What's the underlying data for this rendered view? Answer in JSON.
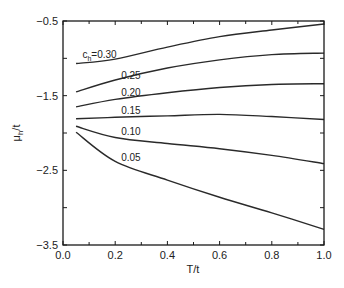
{
  "chart_data": {
    "type": "line",
    "title": "",
    "xlabel": "T/t",
    "ylabel": "μh/t",
    "xlim": [
      0.0,
      1.0
    ],
    "ylim": [
      -3.5,
      -0.5
    ],
    "xticks": [
      "0.0",
      "0.2",
      "0.4",
      "0.6",
      "0.8",
      "1.0"
    ],
    "yticks": [
      "-3.5",
      "-2.5",
      "-1.5",
      "-0.5"
    ],
    "grid": false,
    "legend": "inline labels",
    "x": [
      0.05,
      0.2,
      0.4,
      0.6,
      0.8,
      1.0
    ],
    "series": [
      {
        "name": "c_h=0.30",
        "label": "ch=0.30",
        "values": [
          -1.07,
          -1.01,
          -0.85,
          -0.71,
          -0.62,
          -0.54
        ]
      },
      {
        "name": "0.25",
        "label": "0.25",
        "values": [
          -1.45,
          -1.29,
          -1.13,
          -1.02,
          -0.95,
          -0.93
        ]
      },
      {
        "name": "0.20",
        "label": "0.20",
        "values": [
          -1.65,
          -1.55,
          -1.46,
          -1.39,
          -1.35,
          -1.34
        ]
      },
      {
        "name": "0.15",
        "label": "0.15",
        "values": [
          -1.81,
          -1.79,
          -1.77,
          -1.75,
          -1.78,
          -1.82
        ]
      },
      {
        "name": "0.10",
        "label": "0.10",
        "values": [
          -1.91,
          -2.06,
          -2.14,
          -2.21,
          -2.3,
          -2.41
        ]
      },
      {
        "name": "0.05",
        "label": "0.05",
        "values": [
          -1.99,
          -2.38,
          -2.63,
          -2.86,
          -3.07,
          -3.29
        ]
      }
    ],
    "label_positions": [
      {
        "T": 0.14,
        "mu": -1.0
      },
      {
        "T": 0.26,
        "mu": -1.28
      },
      {
        "T": 0.26,
        "mu": -1.5
      },
      {
        "T": 0.26,
        "mu": -1.75
      },
      {
        "T": 0.26,
        "mu": -2.03
      },
      {
        "T": 0.26,
        "mu": -2.38
      }
    ]
  },
  "colors": {
    "line": "#2a2a2a",
    "axis": "#1a1a1a",
    "background": "#ffffff"
  }
}
